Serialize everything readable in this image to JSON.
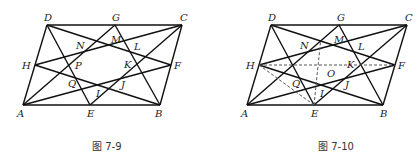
{
  "figures": [
    {
      "caption": "图 7-9",
      "points": {
        "A": [
          23,
          105
        ],
        "E": [
          90,
          105
        ],
        "B": [
          160,
          105
        ],
        "D": [
          47,
          25
        ],
        "G": [
          115,
          25
        ],
        "C": [
          182,
          25
        ],
        "H": [
          35,
          65
        ],
        "F": [
          171,
          65
        ]
      },
      "labels": [
        {
          "t": "D",
          "x": 44,
          "y": 21
        },
        {
          "t": "G",
          "x": 112,
          "y": 21
        },
        {
          "t": "C",
          "x": 180,
          "y": 21
        },
        {
          "t": "H",
          "x": 22,
          "y": 69
        },
        {
          "t": "F",
          "x": 174,
          "y": 69
        },
        {
          "t": "A",
          "x": 17,
          "y": 117
        },
        {
          "t": "E",
          "x": 87,
          "y": 117
        },
        {
          "t": "B",
          "x": 155,
          "y": 117
        },
        {
          "t": "N",
          "x": 76,
          "y": 49
        },
        {
          "t": "M",
          "x": 111,
          "y": 43
        },
        {
          "t": "L",
          "x": 134,
          "y": 50
        },
        {
          "t": "P",
          "x": 75,
          "y": 69
        },
        {
          "t": "K",
          "x": 124,
          "y": 68
        },
        {
          "t": "Q",
          "x": 68,
          "y": 87
        },
        {
          "t": "I",
          "x": 96,
          "y": 97
        },
        {
          "t": "J",
          "x": 121,
          "y": 88
        }
      ],
      "dashed": []
    },
    {
      "caption": "图 7-10",
      "points": {
        "A": [
          247,
          105
        ],
        "E": [
          314,
          105
        ],
        "B": [
          383,
          105
        ],
        "D": [
          271,
          25
        ],
        "G": [
          339,
          25
        ],
        "C": [
          407,
          25
        ],
        "H": [
          259,
          65
        ],
        "F": [
          395,
          65
        ]
      },
      "labels": [
        {
          "t": "D",
          "x": 268,
          "y": 21
        },
        {
          "t": "G",
          "x": 337,
          "y": 21
        },
        {
          "t": "C",
          "x": 405,
          "y": 21
        },
        {
          "t": "H",
          "x": 246,
          "y": 69
        },
        {
          "t": "F",
          "x": 398,
          "y": 69
        },
        {
          "t": "A",
          "x": 241,
          "y": 117
        },
        {
          "t": "E",
          "x": 311,
          "y": 117
        },
        {
          "t": "B",
          "x": 380,
          "y": 117
        },
        {
          "t": "N",
          "x": 300,
          "y": 49
        },
        {
          "t": "M",
          "x": 334,
          "y": 43
        },
        {
          "t": "L",
          "x": 358,
          "y": 50
        },
        {
          "t": "O",
          "x": 327,
          "y": 77
        },
        {
          "t": "K",
          "x": 347,
          "y": 68
        },
        {
          "t": "Q",
          "x": 292,
          "y": 87
        },
        {
          "t": "I",
          "x": 320,
          "y": 97
        },
        {
          "t": "J",
          "x": 345,
          "y": 88
        }
      ],
      "dashed": [
        [
          "H",
          "F"
        ],
        [
          "H",
          "E"
        ],
        [
          "E",
          "M"
        ]
      ]
    }
  ],
  "solid_segments": [
    [
      "A",
      "B"
    ],
    [
      "B",
      "C"
    ],
    [
      "C",
      "D"
    ],
    [
      "D",
      "A"
    ],
    [
      "D",
      "E"
    ],
    [
      "D",
      "F"
    ],
    [
      "G",
      "A"
    ],
    [
      "G",
      "B"
    ],
    [
      "C",
      "H"
    ],
    [
      "C",
      "E"
    ],
    [
      "H",
      "B"
    ],
    [
      "A",
      "F"
    ]
  ]
}
